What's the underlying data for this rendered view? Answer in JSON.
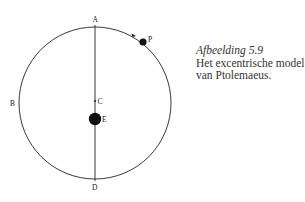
{
  "diagram": {
    "points": {
      "A": "A",
      "B": "B",
      "C": "C",
      "D": "D",
      "E": "E",
      "P": "P"
    },
    "colors": {
      "stroke": "#222222",
      "background": "#ffffff"
    }
  },
  "caption": {
    "figure": "Afbeelding 5.9",
    "line1": "Het excentrische model",
    "line2": "van Ptolemaeus."
  }
}
